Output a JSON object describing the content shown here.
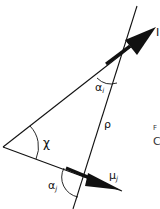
{
  "diagram": {
    "type": "geometry",
    "vertices": {
      "left": [
        3,
        147
      ],
      "upper_right": [
        112,
        45
      ],
      "lower_right": [
        83,
        173
      ]
    },
    "lines": [
      {
        "id": "line-upper",
        "from": [
          3,
          147
        ],
        "to": [
          155,
          28
        ]
      },
      {
        "id": "line-lower",
        "from": [
          3,
          147
        ],
        "to": [
          122,
          191
        ]
      },
      {
        "id": "line-rho",
        "from": [
          137,
          6
        ],
        "to": [
          73,
          209
        ]
      }
    ],
    "arrows": [
      {
        "id": "arrow-mu-i",
        "from": [
          106,
          64
        ],
        "to": [
          156,
          27
        ],
        "label": "μ_i"
      },
      {
        "id": "arrow-mu-j",
        "from": [
          66,
          168
        ],
        "to": [
          121,
          190
        ],
        "label": "μ_j"
      }
    ],
    "labels": {
      "alpha_i": {
        "base": "α",
        "sub": "i"
      },
      "alpha_j": {
        "base": "α",
        "sub": "j"
      },
      "chi": "χ",
      "rho": "ρ",
      "mu_j": {
        "base": "μ",
        "sub": "j"
      },
      "mu_i_partial": "I",
      "edge_text_1": "F",
      "edge_text_2": "C"
    },
    "colors": {
      "line": "#111111",
      "background": "#ffffff"
    }
  }
}
